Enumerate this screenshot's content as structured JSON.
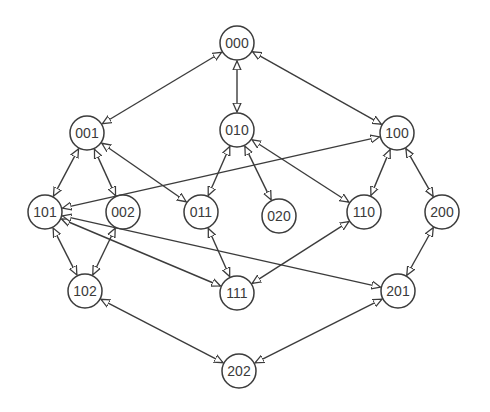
{
  "diagram": {
    "type": "lattice-graph",
    "colors": {
      "stroke": "#3c3c3c",
      "node_fill": "#ffffff",
      "background": "#ffffff",
      "text": "#3a3a3a"
    },
    "node_radius": 17,
    "nodes": [
      {
        "id": "000",
        "label": "000",
        "x": 237,
        "y": 43
      },
      {
        "id": "001",
        "label": "001",
        "x": 87,
        "y": 133
      },
      {
        "id": "010",
        "label": "010",
        "x": 237,
        "y": 130
      },
      {
        "id": "100",
        "label": "100",
        "x": 397,
        "y": 133
      },
      {
        "id": "101",
        "label": "101",
        "x": 45,
        "y": 212
      },
      {
        "id": "002",
        "label": "002",
        "x": 123,
        "y": 212
      },
      {
        "id": "011",
        "label": "011",
        "x": 201,
        "y": 212
      },
      {
        "id": "020",
        "label": "020",
        "x": 279,
        "y": 216
      },
      {
        "id": "110",
        "label": "110",
        "x": 364,
        "y": 212
      },
      {
        "id": "200",
        "label": "200",
        "x": 442,
        "y": 212
      },
      {
        "id": "102",
        "label": "102",
        "x": 85,
        "y": 291
      },
      {
        "id": "111",
        "label": "111",
        "x": 237,
        "y": 293
      },
      {
        "id": "201",
        "label": "201",
        "x": 398,
        "y": 291
      },
      {
        "id": "202",
        "label": "202",
        "x": 239,
        "y": 371
      }
    ],
    "edges": [
      {
        "from": "000",
        "to": "001",
        "bidirectional": true
      },
      {
        "from": "000",
        "to": "010",
        "bidirectional": true
      },
      {
        "from": "000",
        "to": "100",
        "bidirectional": true
      },
      {
        "from": "001",
        "to": "101",
        "bidirectional": true
      },
      {
        "from": "001",
        "to": "002",
        "bidirectional": true
      },
      {
        "from": "001",
        "to": "011",
        "bidirectional": true
      },
      {
        "from": "010",
        "to": "011",
        "bidirectional": true
      },
      {
        "from": "010",
        "to": "020",
        "bidirectional": true
      },
      {
        "from": "010",
        "to": "110",
        "bidirectional": true
      },
      {
        "from": "100",
        "to": "101",
        "bidirectional": true
      },
      {
        "from": "100",
        "to": "110",
        "bidirectional": true
      },
      {
        "from": "100",
        "to": "200",
        "bidirectional": true
      },
      {
        "from": "101",
        "to": "102",
        "bidirectional": true
      },
      {
        "from": "002",
        "to": "102",
        "bidirectional": true
      },
      {
        "from": "011",
        "to": "111",
        "bidirectional": true
      },
      {
        "from": "110",
        "to": "111",
        "bidirectional": true
      },
      {
        "from": "200",
        "to": "201",
        "bidirectional": true
      },
      {
        "from": "101",
        "to": "111",
        "bidirectional": true
      },
      {
        "from": "101",
        "to": "201",
        "bidirectional": true
      },
      {
        "from": "102",
        "to": "202",
        "bidirectional": true
      },
      {
        "from": "201",
        "to": "202",
        "bidirectional": true
      }
    ]
  }
}
